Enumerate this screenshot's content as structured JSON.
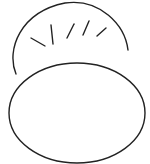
{
  "drawing": {
    "description": "Line sketch of two overlapping ovals with short tick marks along the upper curve",
    "stroke_color": "#222222",
    "background": "#ffffff",
    "back_shape": {
      "cx": 71,
      "cy": 55,
      "rx": 59,
      "ry": 53
    },
    "front_shape": {
      "cx": 77,
      "cy": 113,
      "rx": 68,
      "ry": 50
    },
    "ticks": [
      {
        "x1": 31,
        "y1": 38,
        "x2": 45,
        "y2": 46
      },
      {
        "x1": 51,
        "y1": 25,
        "x2": 53,
        "y2": 44
      },
      {
        "x1": 74,
        "y1": 24,
        "x2": 67,
        "y2": 38
      },
      {
        "x1": 89,
        "y1": 21,
        "x2": 83,
        "y2": 35
      },
      {
        "x1": 106,
        "y1": 28,
        "x2": 97,
        "y2": 36
      }
    ]
  }
}
